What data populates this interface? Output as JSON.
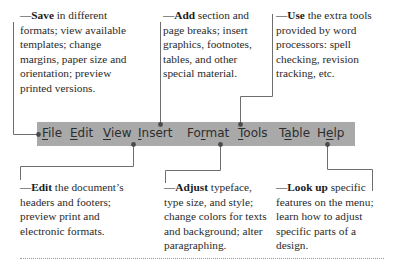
{
  "menubar": {
    "background": "#a9a9a9",
    "items": [
      {
        "label": "File",
        "mnemonic_index": 0,
        "pre": "",
        "key": "F",
        "post": "ile"
      },
      {
        "label": "Edit",
        "mnemonic_index": 0,
        "pre": "",
        "key": "E",
        "post": "dit"
      },
      {
        "label": "View",
        "mnemonic_index": 0,
        "pre": "",
        "key": "V",
        "post": "iew"
      },
      {
        "label": "Insert",
        "mnemonic_index": 0,
        "pre": "",
        "key": "I",
        "post": "nsert"
      },
      {
        "label": "Format",
        "mnemonic_index": 2,
        "pre": "Fo",
        "key": "r",
        "post": "mat"
      },
      {
        "label": "Tools",
        "mnemonic_index": 0,
        "pre": "",
        "key": "T",
        "post": "ools"
      },
      {
        "label": "Table",
        "mnemonic_index": 1,
        "pre": "T",
        "key": "a",
        "post": "ble"
      },
      {
        "label": "Help",
        "mnemonic_index": 1,
        "pre": "H",
        "key": "e",
        "post": "lp"
      }
    ]
  },
  "annotations": {
    "save": {
      "dash": "—",
      "keyword": "Save",
      "text": " in different formats; view available templates; change margins, paper size and orientation; preview printed versions.",
      "target": "File"
    },
    "add": {
      "dash": "—",
      "keyword": "Add",
      "text": " section and page breaks; insert graphics, footnotes, tables, and other special material.",
      "target": "Insert"
    },
    "use": {
      "dash": "—",
      "keyword": "Use",
      "text": " the extra tools provided by word processors: spell checking, revision tracking, etc.",
      "target": "Tools"
    },
    "edit": {
      "dash": "—",
      "keyword": "Edit",
      "text": " the document’s headers and footers; preview print and electronic formats.",
      "target": "View"
    },
    "adjust": {
      "dash": "—",
      "keyword": "Adjust",
      "text": " typeface, type size, and style; change colors for texts and background; alter paragraphing.",
      "target": "Format"
    },
    "lookup": {
      "dash": "—",
      "keyword": "Look up",
      "text": " specific features on the menu; learn how to adjust specific parts of a design.",
      "target": "Help"
    }
  },
  "colors": {
    "connector": "#6e6e6e",
    "dot": "#4a4a4a",
    "text": "#2a2a2a",
    "rule": "#9a9a9a"
  }
}
